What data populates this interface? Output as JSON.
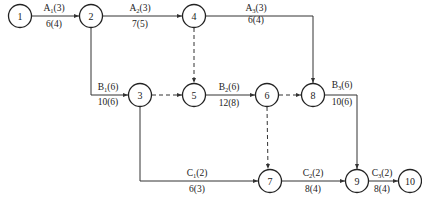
{
  "diagram": {
    "type": "activity-on-arrow network",
    "line_color": "#333333",
    "nodes": [
      {
        "id": "1",
        "x": 20,
        "y": 16
      },
      {
        "id": "2",
        "x": 91,
        "y": 16
      },
      {
        "id": "3",
        "x": 140,
        "y": 95
      },
      {
        "id": "4",
        "x": 194,
        "y": 16
      },
      {
        "id": "5",
        "x": 194,
        "y": 95
      },
      {
        "id": "6",
        "x": 267,
        "y": 95
      },
      {
        "id": "7",
        "x": 270,
        "y": 181
      },
      {
        "id": "8",
        "x": 313,
        "y": 95
      },
      {
        "id": "9",
        "x": 357,
        "y": 181
      },
      {
        "id": "10",
        "x": 410,
        "y": 181
      }
    ],
    "activities": [
      {
        "from": "1",
        "to": "2",
        "name": "A",
        "sub": "1",
        "dur": "(3)",
        "cost": "6(4)",
        "dashed": false
      },
      {
        "from": "2",
        "to": "4",
        "name": "A",
        "sub": "2",
        "dur": "(3)",
        "cost": "7(5)",
        "dashed": false
      },
      {
        "from": "4",
        "to": "8",
        "name": "A",
        "sub": "3",
        "dur": "(3)",
        "cost": "6(4)",
        "dashed": false
      },
      {
        "from": "2",
        "to": "3",
        "name": "B",
        "sub": "1",
        "dur": "(6)",
        "cost": "10(6)",
        "dashed": false
      },
      {
        "from": "5",
        "to": "6",
        "name": "B",
        "sub": "2",
        "dur": "(6)",
        "cost": "12(8)",
        "dashed": false
      },
      {
        "from": "8",
        "to": "9",
        "name": "B",
        "sub": "3",
        "dur": "(6)",
        "cost": "10(6)",
        "dashed": false
      },
      {
        "from": "3",
        "to": "7",
        "name": "C",
        "sub": "1",
        "dur": "(2)",
        "cost": "6(3)",
        "dashed": false
      },
      {
        "from": "7",
        "to": "9",
        "name": "C",
        "sub": "2",
        "dur": "(2)",
        "cost": "8(4)",
        "dashed": false
      },
      {
        "from": "9",
        "to": "10",
        "name": "C",
        "sub": "3",
        "dur": "(2)",
        "cost": "8(4)",
        "dashed": false
      },
      {
        "from": "4",
        "to": "5",
        "dashed": true
      },
      {
        "from": "3",
        "to": "5",
        "dashed": true
      },
      {
        "from": "6",
        "to": "8",
        "dashed": true
      },
      {
        "from": "6",
        "to": "7",
        "dashed": true
      }
    ]
  }
}
